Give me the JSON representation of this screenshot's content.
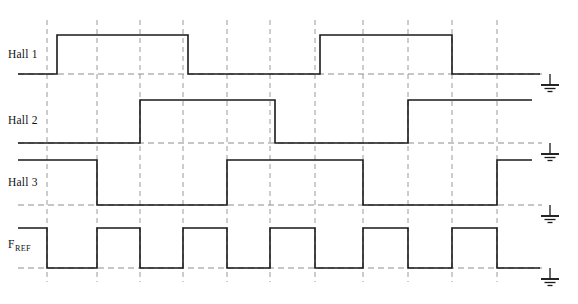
{
  "figure": {
    "type": "timing-diagram",
    "title_strip": "",
    "background_color": "#ffffff",
    "signal_color": "#1a1a1a",
    "grid_color": "#9a9a9a",
    "baseline_color": "#8d8d8d",
    "width": 578,
    "height": 304
  },
  "geometry": {
    "plot_left": 47,
    "plot_right": 540,
    "grid_x": [
      47,
      97,
      140,
      183,
      227,
      270,
      315,
      363,
      408,
      452,
      497
    ],
    "grid_top": 20,
    "grid_bottom": 282,
    "ground_x": 550,
    "label_x": 8
  },
  "signals": [
    {
      "name": "Hall 1",
      "label": "Hall 1",
      "has_subscript": false,
      "subscript": "",
      "label_y": 58,
      "high_y": 35,
      "low_y": 74,
      "line_start_x": 18,
      "line_end_x": 540,
      "ground_y": 74,
      "initial_state": 0,
      "transitions": [
        {
          "x": 57,
          "to": 1
        },
        {
          "x": 188,
          "to": 0
        },
        {
          "x": 320,
          "to": 1
        },
        {
          "x": 452,
          "to": 0
        }
      ]
    },
    {
      "name": "Hall 2",
      "label": "Hall 2",
      "has_subscript": false,
      "subscript": "",
      "label_y": 124,
      "high_y": 100,
      "low_y": 143,
      "line_start_x": 18,
      "line_end_x": 532,
      "ground_y": 143,
      "initial_state": 0,
      "transitions": [
        {
          "x": 140,
          "to": 1
        },
        {
          "x": 275,
          "to": 0
        },
        {
          "x": 408,
          "to": 1
        }
      ]
    },
    {
      "name": "Hall 3",
      "label": "Hall 3",
      "has_subscript": false,
      "subscript": "",
      "label_y": 186,
      "high_y": 160,
      "low_y": 205,
      "line_start_x": 18,
      "line_end_x": 532,
      "ground_y": 205,
      "initial_state": 1,
      "transitions": [
        {
          "x": 97,
          "to": 0
        },
        {
          "x": 227,
          "to": 1
        },
        {
          "x": 363,
          "to": 0
        },
        {
          "x": 497,
          "to": 1
        }
      ]
    },
    {
      "name": "F_REF",
      "label": "F",
      "has_subscript": true,
      "subscript": "REF",
      "label_y": 248,
      "high_y": 228,
      "low_y": 268,
      "line_start_x": 18,
      "line_end_x": 540,
      "ground_y": 268,
      "initial_state": 1,
      "transitions": [
        {
          "x": 47,
          "to": 0
        },
        {
          "x": 97,
          "to": 1
        },
        {
          "x": 140,
          "to": 0
        },
        {
          "x": 183,
          "to": 1
        },
        {
          "x": 227,
          "to": 0
        },
        {
          "x": 270,
          "to": 1
        },
        {
          "x": 315,
          "to": 0
        },
        {
          "x": 363,
          "to": 1
        },
        {
          "x": 408,
          "to": 0
        },
        {
          "x": 452,
          "to": 1
        },
        {
          "x": 497,
          "to": 0
        }
      ]
    }
  ],
  "grounds": [
    {
      "name": "ground-hall1",
      "x": 550,
      "y": 74
    },
    {
      "name": "ground-hall2",
      "x": 550,
      "y": 143
    },
    {
      "name": "ground-hall3",
      "x": 550,
      "y": 205
    },
    {
      "name": "ground-fref",
      "x": 550,
      "y": 268
    }
  ],
  "chart_data": {
    "type": "line",
    "title": "",
    "xlabel": "",
    "ylabel": "",
    "grid": true,
    "legend_position": "left-labels",
    "x_gridlines": [
      47,
      97,
      140,
      183,
      227,
      270,
      315,
      363,
      408,
      452,
      497
    ],
    "series": [
      {
        "name": "Hall 1",
        "values": [
          0,
          1,
          1,
          1,
          0,
          0,
          0,
          1,
          1,
          1,
          0,
          0
        ]
      },
      {
        "name": "Hall 2",
        "values": [
          0,
          0,
          0,
          1,
          1,
          1,
          0,
          0,
          0,
          1,
          1,
          1
        ]
      },
      {
        "name": "Hall 3",
        "values": [
          1,
          1,
          0,
          0,
          0,
          1,
          1,
          1,
          0,
          0,
          0,
          1
        ]
      },
      {
        "name": "F_REF",
        "values": [
          1,
          0,
          1,
          0,
          1,
          0,
          1,
          0,
          1,
          0,
          1,
          0
        ]
      }
    ]
  }
}
